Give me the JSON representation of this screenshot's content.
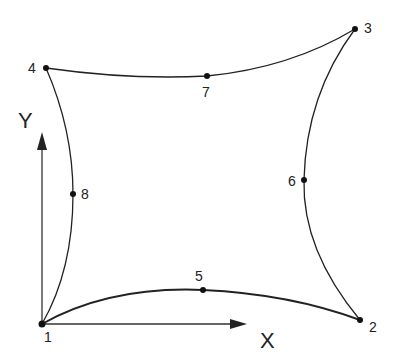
{
  "diagram": {
    "type": "quadrilateral-element-8-node",
    "stroke_color": "#222222",
    "background": "#ffffff",
    "axes": {
      "x_label": "X",
      "y_label": "Y"
    },
    "nodes": [
      {
        "id": "1",
        "label": "1",
        "x": 42,
        "y": 324
      },
      {
        "id": "2",
        "label": "2",
        "x": 360,
        "y": 320
      },
      {
        "id": "3",
        "label": "3",
        "x": 355,
        "y": 29
      },
      {
        "id": "4",
        "label": "4",
        "x": 46,
        "y": 68
      },
      {
        "id": "5",
        "label": "5",
        "x": 203,
        "y": 290
      },
      {
        "id": "6",
        "label": "6",
        "x": 304,
        "y": 180
      },
      {
        "id": "7",
        "label": "7",
        "x": 207,
        "y": 76
      },
      {
        "id": "8",
        "label": "8",
        "x": 73,
        "y": 194
      }
    ],
    "edges": [
      {
        "from": "1",
        "mid": "5",
        "to": "2"
      },
      {
        "from": "2",
        "mid": "6",
        "to": "3"
      },
      {
        "from": "3",
        "mid": "7",
        "to": "4"
      },
      {
        "from": "4",
        "mid": "8",
        "to": "1"
      }
    ]
  }
}
